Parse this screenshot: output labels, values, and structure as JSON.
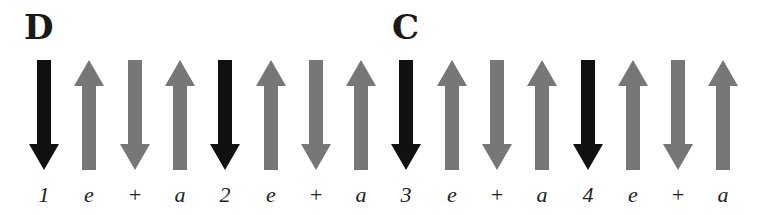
{
  "colors": {
    "down_main": "#111111",
    "up": "#777777",
    "down_offbeat": "#777777"
  },
  "chords": [
    {
      "label": "D",
      "x": 24
    },
    {
      "label": "C",
      "x": 392
    }
  ],
  "strums": [
    {
      "direction": "down",
      "accent": true,
      "beat": "1",
      "x": 44
    },
    {
      "direction": "up",
      "accent": false,
      "beat": "e",
      "x": 89
    },
    {
      "direction": "down",
      "accent": false,
      "beat": "+",
      "x": 135
    },
    {
      "direction": "up",
      "accent": false,
      "beat": "a",
      "x": 180
    },
    {
      "direction": "down",
      "accent": true,
      "beat": "2",
      "x": 225
    },
    {
      "direction": "up",
      "accent": false,
      "beat": "e",
      "x": 271
    },
    {
      "direction": "down",
      "accent": false,
      "beat": "+",
      "x": 316
    },
    {
      "direction": "up",
      "accent": false,
      "beat": "a",
      "x": 361
    },
    {
      "direction": "down",
      "accent": true,
      "beat": "3",
      "x": 406
    },
    {
      "direction": "up",
      "accent": false,
      "beat": "e",
      "x": 452
    },
    {
      "direction": "down",
      "accent": false,
      "beat": "+",
      "x": 497
    },
    {
      "direction": "up",
      "accent": false,
      "beat": "a",
      "x": 542
    },
    {
      "direction": "down",
      "accent": true,
      "beat": "4",
      "x": 588
    },
    {
      "direction": "up",
      "accent": false,
      "beat": "e",
      "x": 633
    },
    {
      "direction": "down",
      "accent": false,
      "beat": "+",
      "x": 678
    },
    {
      "direction": "up",
      "accent": false,
      "beat": "a",
      "x": 723
    }
  ]
}
